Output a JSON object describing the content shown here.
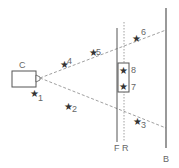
{
  "diagram": {
    "type": "camera-field-of-view",
    "colors": {
      "line": "#555555",
      "dash": "#888888",
      "text": "#666666",
      "star": "#333333"
    },
    "camera": {
      "label": "C",
      "x": 12,
      "y": 71,
      "w": 24,
      "h": 16
    },
    "apex": {
      "x": 40,
      "y": 78
    },
    "rays": [
      {
        "name": "upper-ray",
        "x2": 166,
        "y2": 30
      },
      {
        "name": "lower-ray",
        "x2": 166,
        "y2": 128
      }
    ],
    "planes": [
      {
        "label": "F",
        "x": 117,
        "y1": 28,
        "y2": 142,
        "style": "solid"
      },
      {
        "label": "R",
        "x": 124,
        "y1": 22,
        "y2": 142,
        "style": "dotted"
      },
      {
        "label": "B",
        "x": 166,
        "y1": 8,
        "y2": 148,
        "style": "solid"
      }
    ],
    "box": {
      "x": 118,
      "y": 63,
      "w": 11,
      "h": 29
    },
    "points": [
      {
        "id": "1",
        "x": 35,
        "y": 93
      },
      {
        "id": "2",
        "x": 70,
        "y": 106
      },
      {
        "id": "3",
        "x": 138,
        "y": 121
      },
      {
        "id": "4",
        "x": 65,
        "y": 64
      },
      {
        "id": "5",
        "x": 94,
        "y": 52
      },
      {
        "id": "6",
        "x": 137,
        "y": 37
      },
      {
        "id": "7",
        "x": 124,
        "y": 88
      },
      {
        "id": "8",
        "x": 124,
        "y": 70
      }
    ],
    "labels": {
      "camera": "C",
      "front": "F",
      "rear": "R",
      "back": "B",
      "p1": "1",
      "p2": "2",
      "p3": "3",
      "p4": "4",
      "p5": "5",
      "p6": "6",
      "p7": "7",
      "p8": "8"
    },
    "star_glyph": "★"
  }
}
